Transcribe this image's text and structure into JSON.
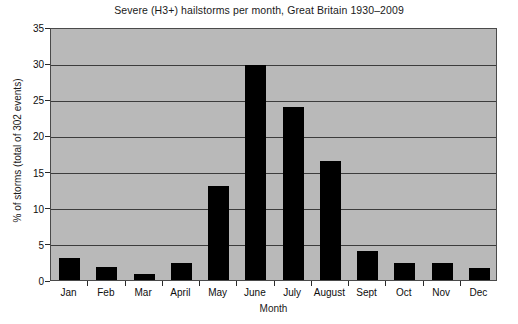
{
  "chart_data": {
    "type": "bar",
    "title": "Severe (H3+) hailstorms per month, Great Britain 1930–2009",
    "xlabel": "Month",
    "ylabel": "% of storms (total of 302 events)",
    "categories": [
      "Jan",
      "Feb",
      "Mar",
      "April",
      "May",
      "June",
      "July",
      "August",
      "Sept",
      "Oct",
      "Nov",
      "Dec"
    ],
    "values": [
      3.0,
      1.8,
      0.8,
      2.3,
      13.0,
      29.7,
      23.9,
      16.4,
      4.0,
      2.4,
      2.4,
      1.7
    ],
    "ylim": [
      0,
      35
    ],
    "ytick_labels": [
      "0",
      "5",
      "10",
      "15",
      "20",
      "25",
      "30",
      "35"
    ],
    "ytick_values": [
      0,
      5,
      10,
      15,
      20,
      25,
      30,
      35
    ],
    "grid": true,
    "legend": "none",
    "colors": {
      "bar": "#000000",
      "plot_background": "#b9b9b9",
      "gridline": "#3c3c3c",
      "axis": "#4a4a4a",
      "text": "#0d0d0d",
      "figure_background": "#ffffff"
    }
  }
}
